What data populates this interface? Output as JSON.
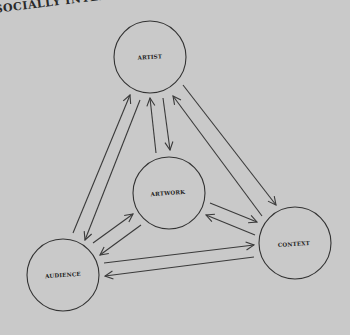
{
  "header": {
    "text": "SOCIALLY INTERACTIVE"
  },
  "diagram": {
    "nodes": [
      {
        "id": "artist",
        "label": "ARTIST",
        "cx": 150,
        "cy": 57,
        "r": 36
      },
      {
        "id": "artwork",
        "label": "ARTWORK",
        "cx": 169,
        "cy": 193,
        "r": 36
      },
      {
        "id": "audience",
        "label": "AUDIENCE",
        "cx": 63,
        "cy": 275,
        "r": 36
      },
      {
        "id": "context",
        "label": "CONTEXT",
        "cx": 295,
        "cy": 243,
        "r": 36
      }
    ],
    "edges": [
      {
        "from": "audience",
        "to": "artist"
      },
      {
        "from": "artist",
        "to": "audience"
      },
      {
        "from": "artwork",
        "to": "artist"
      },
      {
        "from": "artist",
        "to": "artwork"
      },
      {
        "from": "artist",
        "to": "context"
      },
      {
        "from": "context",
        "to": "artist"
      },
      {
        "from": "audience",
        "to": "artwork"
      },
      {
        "from": "artwork",
        "to": "audience"
      },
      {
        "from": "artwork",
        "to": "context"
      },
      {
        "from": "context",
        "to": "artwork"
      },
      {
        "from": "audience",
        "to": "context"
      },
      {
        "from": "context",
        "to": "audience"
      }
    ]
  }
}
